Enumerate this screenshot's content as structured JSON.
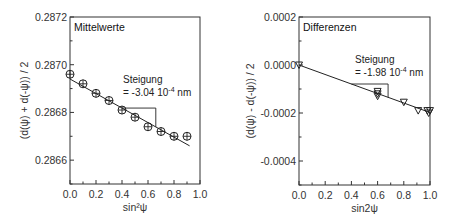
{
  "chart_data": [
    {
      "type": "scatter",
      "title": "Mittelwerte",
      "xlabel": "sin²ψ",
      "ylabel": "(d(ψ) + d(-ψ)) / 2",
      "xlim": [
        0.0,
        1.0
      ],
      "ylim": [
        0.2865,
        0.2872
      ],
      "xticks": [
        "0.0",
        "0.2",
        "0.4",
        "0.6",
        "0.8",
        "1.0"
      ],
      "yticks": [
        "0.2866",
        "0.2868",
        "0.2870",
        "0.2872"
      ],
      "grid": false,
      "marker": "circle-plus",
      "series": [
        {
          "name": "Mittelwerte",
          "x": [
            0.0,
            0.1,
            0.2,
            0.3,
            0.4,
            0.5,
            0.6,
            0.7,
            0.8,
            0.9
          ],
          "y": [
            0.28696,
            0.28692,
            0.28688,
            0.28685,
            0.28681,
            0.28678,
            0.28674,
            0.28672,
            0.2867,
            0.2867
          ]
        }
      ],
      "fit_line": {
        "x": [
          0.0,
          0.92
        ],
        "y": [
          0.28694,
          0.28666
        ]
      },
      "slope_triangle": {
        "x": [
          0.4,
          0.66
        ],
        "y_top": 0.28683
      },
      "annotation": {
        "line1": "Steigung",
        "line2": "= -3.04 10",
        "exp": "-4",
        "unit": " nm"
      }
    },
    {
      "type": "scatter",
      "title": "Differenzen",
      "xlabel": "sin2ψ",
      "ylabel": "(d(ψ) - d(-ψ)) / 2",
      "xlim": [
        0.0,
        1.0
      ],
      "ylim": [
        -0.0005,
        0.0002
      ],
      "xticks": [
        "0.0",
        "0.2",
        "0.4",
        "0.6",
        "0.8",
        "1.0"
      ],
      "yticks": [
        "-0.0004",
        "-0.0002",
        "0.0000",
        "0.0002"
      ],
      "grid": false,
      "marker": "triangle-down",
      "series": [
        {
          "name": "Differenzen",
          "x": [
            0.0,
            0.6,
            0.6,
            0.6,
            0.8,
            0.91,
            0.98,
            0.99,
            1.0
          ],
          "y": [
            0.0,
            -0.00011,
            -0.00012,
            -0.00013,
            -0.000155,
            -0.00019,
            -0.00019,
            -0.0002,
            -0.00019
          ]
        }
      ],
      "fit_line": {
        "x": [
          0.0,
          1.0
        ],
        "y": [
          0.0,
          -0.000198
        ]
      },
      "slope_triangle": {
        "x": [
          0.4,
          0.68
        ],
        "y_top": -8.2e-05
      },
      "annotation": {
        "line1": "Steigung",
        "line2": "= -1.98 10",
        "exp": "-4",
        "unit": " nm"
      }
    }
  ]
}
